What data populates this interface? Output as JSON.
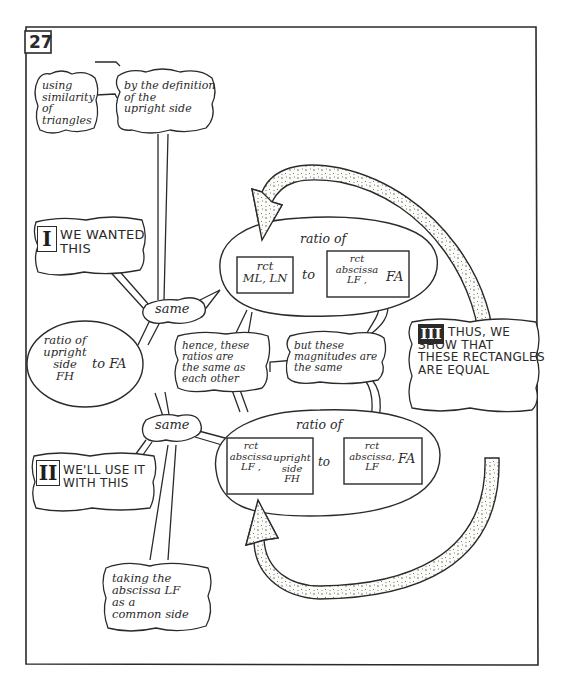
{
  "panel": {
    "number": "27"
  },
  "callouts": {
    "similarity": "using\nsimilarity\nof\ntriangles",
    "definition": "by the definition\nof the\nupright side",
    "wanted": {
      "roman": "I",
      "text": "WE WANTED\nTHIS"
    },
    "use_it": {
      "roman": "II",
      "text": "WE'LL USE IT\nWITH THIS"
    },
    "show": {
      "roman": "III",
      "text": "THUS, WE\nSHOW THAT\nTHESE RECTANGLES\nARE EQUAL"
    },
    "hence": "hence, these\nratios are\nthe same as\neach other",
    "but_these": "but these\nmagnitudes are\nthe same",
    "common_side": "taking the\nabscissa LF\nas a\ncommon side",
    "same_top": "same",
    "same_bottom": "same"
  },
  "left_ellipse": {
    "text_a": "ratio of\nupright\nside\nFH",
    "text_b": "to FA"
  },
  "top_ellipse": {
    "title": "ratio of",
    "box1": "rct\nML, LN",
    "to": "to",
    "box2_a": "rct\nabscissa\nLF ,",
    "box2_b": "FA"
  },
  "bottom_ellipse": {
    "title": "ratio of",
    "box1_a": "rct\nabscissa\nLF ,",
    "box1_b": "upright\nside\nFH",
    "to": "to",
    "box2_a": "rct\nabscissa,\nLF",
    "box2_b": "FA"
  },
  "colors": {
    "ink": "#2a2a2a",
    "paper": "#ffffff",
    "arrow_fill": "#f4f4f0"
  }
}
